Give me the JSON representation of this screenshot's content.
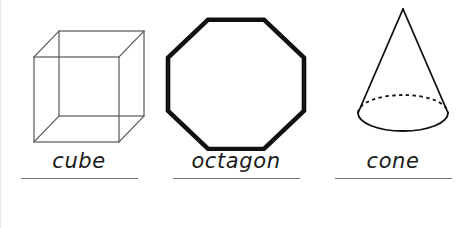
{
  "worksheet": {
    "background_color": "#ffffff",
    "ink_color": "#1b1b1b",
    "rule_color": "#6f6f6f",
    "wireframe_color": "#585858",
    "shapes": [
      {
        "key": "cube",
        "label": "cube",
        "figure_name": "cube-wireframe",
        "style": "3d-wireframe-transparent",
        "stroke_color": "#585858",
        "stroke_width": 1.2,
        "filled": false,
        "underline_width_px": 117
      },
      {
        "key": "octagon",
        "label": "octagon",
        "figure_name": "octagon-outline",
        "style": "2d-regular-polygon",
        "sides": 8,
        "stroke_color": "#111111",
        "stroke_width": 4.2,
        "filled": false,
        "underline_width_px": 127
      },
      {
        "key": "cone",
        "label": "cone",
        "figure_name": "cone-solid",
        "style": "3d-solid-with-hidden-edge",
        "stroke_color": "#111111",
        "stroke_width": 1.8,
        "hidden_edge_style": "dashed",
        "filled": false,
        "underline_width_px": 117
      }
    ]
  }
}
